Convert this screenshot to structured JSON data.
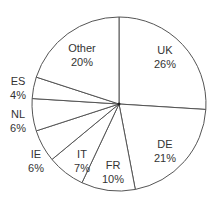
{
  "chart_data": {
    "type": "pie",
    "title": "",
    "start_angle": "12 o'clock",
    "direction": "clockwise",
    "categories": [
      "UK",
      "DE",
      "FR",
      "IT",
      "IE",
      "NL",
      "ES",
      "Other"
    ],
    "values": [
      26,
      21,
      10,
      7,
      6,
      6,
      4,
      20
    ],
    "value_labels": [
      "26%",
      "21%",
      "10%",
      "7%",
      "6%",
      "6%",
      "4%",
      "20%"
    ],
    "legend": "none",
    "colors": {
      "fill": "#ffffff",
      "stroke": "#555555",
      "text": "#333333"
    }
  },
  "labels": [
    {
      "name": "UK",
      "pct": "26%",
      "x": 165,
      "y": 50
    },
    {
      "name": "DE",
      "pct": "21%",
      "x": 165,
      "y": 144
    },
    {
      "name": "FR",
      "pct": "10%",
      "x": 113,
      "y": 165
    },
    {
      "name": "IT",
      "pct": "7%",
      "x": 82,
      "y": 154
    },
    {
      "name": "IE",
      "pct": "6%",
      "x": 36,
      "y": 154
    },
    {
      "name": "NL",
      "pct": "6%",
      "x": 18,
      "y": 114
    },
    {
      "name": "ES",
      "pct": "4%",
      "x": 18,
      "y": 81
    },
    {
      "name": "Other",
      "pct": "20%",
      "x": 82,
      "y": 48
    }
  ]
}
